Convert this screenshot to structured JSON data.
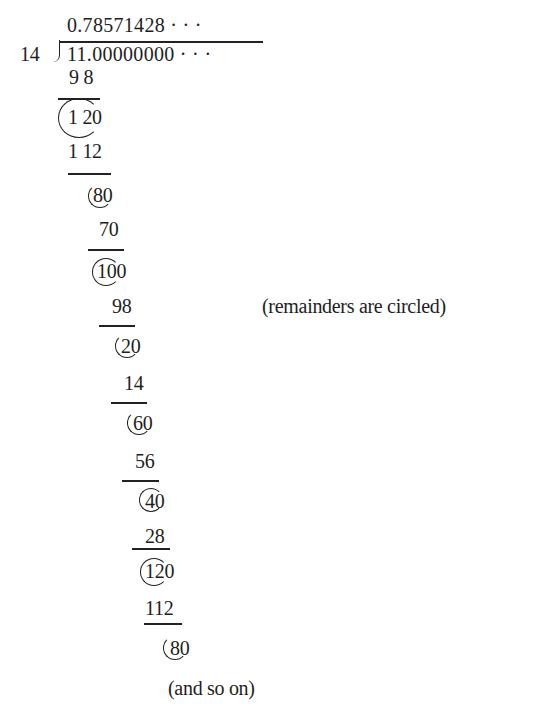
{
  "division": {
    "divisor": "14",
    "dividend": "11.00000000 · · ·",
    "quotient": "0.78571428 · · ·",
    "steps": [
      {
        "product": "9 8",
        "remainder": "1 20"
      },
      {
        "product": "1 12",
        "remainder": "80"
      },
      {
        "product": "70",
        "remainder": "100"
      },
      {
        "product": "98",
        "remainder": "20"
      },
      {
        "product": "14",
        "remainder": "60"
      },
      {
        "product": "56",
        "remainder": "40"
      },
      {
        "product": "28",
        "remainder": "120"
      },
      {
        "product": "112",
        "remainder": "80"
      }
    ]
  },
  "annotations": {
    "remainders_note": "(remainders are circled)",
    "continuation": "(and so on)"
  }
}
